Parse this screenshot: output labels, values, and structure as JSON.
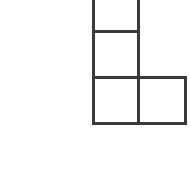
{
  "canvas": {
    "width": 190,
    "height": 175,
    "background_color": "#ffffff",
    "description": "Line drawing of a polyomino shape on a plain white background"
  },
  "figure": {
    "name": "polyomino-shape",
    "kind": "L-shaped polyomino",
    "cell_count": 4,
    "stroke_color": "#3a3a3a",
    "stroke_width": 3,
    "fill_color": "#ffffff",
    "clipped_at_top": true,
    "grid": {
      "cell_size": 46,
      "x_lines": [
        93,
        138,
        185
      ],
      "y_lines": [
        31,
        77,
        123
      ],
      "top_clip_y": 0
    },
    "cells": [
      {
        "id": "cell-top",
        "label": "top square (clipped)",
        "col": 0,
        "row": 0,
        "x": 93,
        "y": 0,
        "width": 45,
        "height": 31
      },
      {
        "id": "cell-middle",
        "label": "middle square",
        "col": 0,
        "row": 1,
        "x": 93,
        "y": 31,
        "width": 45,
        "height": 46
      },
      {
        "id": "cell-bottom-left",
        "label": "bottom left square",
        "col": 0,
        "row": 2,
        "x": 93,
        "y": 77,
        "width": 45,
        "height": 46
      },
      {
        "id": "cell-bottom-right",
        "label": "bottom right square",
        "col": 1,
        "row": 2,
        "x": 138,
        "y": 77,
        "width": 47,
        "height": 46
      }
    ],
    "segments": [
      {
        "id": "outline-left",
        "label": "left outer vertical edge",
        "x1": 93,
        "y1": 0,
        "x2": 93,
        "y2": 123
      },
      {
        "id": "outline-bottom",
        "label": "bottom outer edge",
        "x1": 93,
        "y1": 123,
        "x2": 185,
        "y2": 123
      },
      {
        "id": "outline-right-lower",
        "label": "right outer edge of bottom right square",
        "x1": 185,
        "y1": 123,
        "x2": 185,
        "y2": 77
      },
      {
        "id": "outline-step-top",
        "label": "top edge of bottom right square",
        "x1": 185,
        "y1": 77,
        "x2": 138,
        "y2": 77
      },
      {
        "id": "outline-right-upper",
        "label": "right outer vertical edge of column",
        "x1": 138,
        "y1": 77,
        "x2": 138,
        "y2": 0
      },
      {
        "id": "divider-upper-horizontal",
        "label": "horizontal divider between top and middle squares",
        "x1": 93,
        "y1": 31,
        "x2": 138,
        "y2": 31
      },
      {
        "id": "divider-lower-horizontal",
        "label": "horizontal divider between middle and bottom squares",
        "x1": 93,
        "y1": 77,
        "x2": 138,
        "y2": 77
      },
      {
        "id": "divider-vertical",
        "label": "vertical divider between bottom left and bottom right squares",
        "x1": 138,
        "y1": 77,
        "x2": 138,
        "y2": 123
      }
    ]
  }
}
